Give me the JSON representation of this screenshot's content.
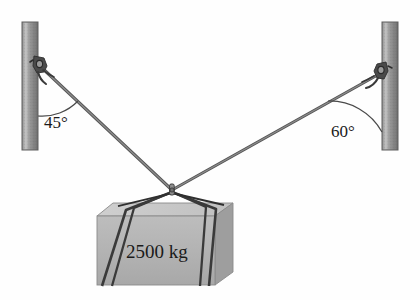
{
  "diagram": {
    "background_color": "#fefefe",
    "labels": {
      "left_angle": "45°",
      "right_angle": "60°",
      "mass": "2500 kg"
    },
    "colors": {
      "post_light": "#b9b9b9",
      "post_mid": "#8f8f8f",
      "post_dark": "#6b6b6b",
      "post_outline": "#5a5a5a",
      "cable": "#6e6e6e",
      "cable_dark": "#4a4a4a",
      "bracket": "#3c3c3c",
      "block_top": "#c9c9c9",
      "block_front": "#b3b3b3",
      "block_side": "#9c9c9c",
      "block_outline": "#7a7a7a",
      "sling": "#3a3a3a",
      "text": "#1a1a1a",
      "arc": "#4a4a4a"
    },
    "geometry": {
      "left_post": {
        "x": 22,
        "y": 22,
        "width": 16,
        "height": 128
      },
      "right_post": {
        "x": 382,
        "y": 22,
        "width": 16,
        "height": 128
      },
      "left_anchor": {
        "x": 40,
        "y": 66
      },
      "right_anchor": {
        "x": 381,
        "y": 73
      },
      "knot": {
        "x": 172,
        "y": 190
      },
      "left_angle_value": 45,
      "right_angle_value": 60
    },
    "block": {
      "front_face": {
        "left": 97,
        "right": 215,
        "top": 215,
        "bottom": 285
      },
      "top_face_depth": 16,
      "side_face_width": 18
    }
  }
}
